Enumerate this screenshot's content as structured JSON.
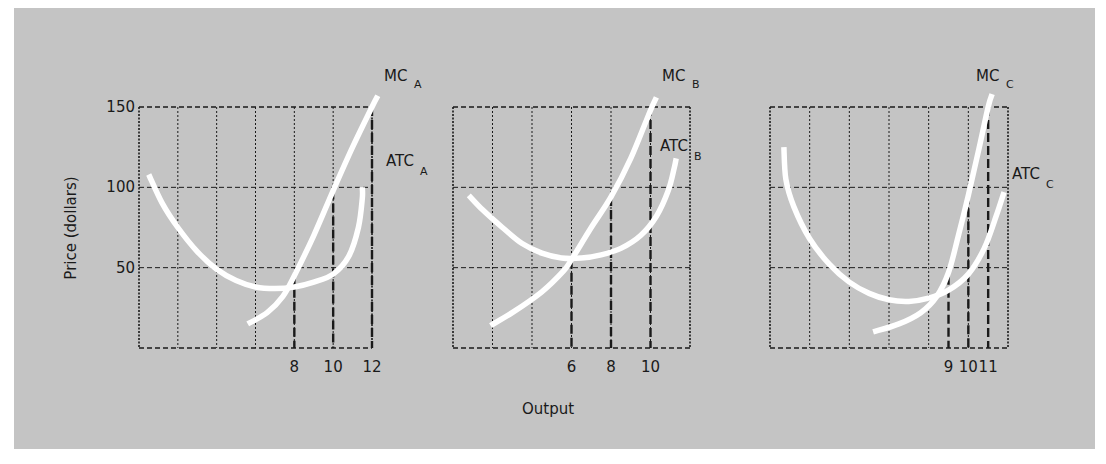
{
  "chart_data": {
    "type": "line",
    "ylabel": "Price (dollars)",
    "xlabel": "Output",
    "colors": {
      "background": "#c4c4c4",
      "curve": "#ffffff",
      "grid": "#1a1a1a",
      "text": "#1a1a1a"
    },
    "panels": [
      {
        "id": "A",
        "xlim": [
          0,
          12
        ],
        "ylim": [
          0,
          150
        ],
        "yticks": [
          50,
          100,
          150
        ],
        "ytick_labels": [
          "50",
          "100",
          "150"
        ],
        "xtick_labels": [
          {
            "value": 8,
            "label": "8"
          },
          {
            "value": 10,
            "label": "10"
          },
          {
            "value": 12,
            "label": "12"
          }
        ],
        "drop_lines": [
          {
            "x": 8,
            "y": 45
          },
          {
            "x": 10,
            "y": 98
          },
          {
            "x": 12,
            "y": 150
          }
        ],
        "series": [
          {
            "name": "MC",
            "subscript": "A",
            "points": [
              [
                5.6,
                15
              ],
              [
                6.6,
                22
              ],
              [
                7.4,
                32
              ],
              [
                8,
                45
              ],
              [
                9,
                70
              ],
              [
                10,
                98
              ],
              [
                11,
                125
              ],
              [
                12,
                150
              ],
              [
                12.3,
                157
              ]
            ]
          },
          {
            "name": "ATC",
            "subscript": "A",
            "points": [
              [
                0.5,
                108
              ],
              [
                1.2,
                90
              ],
              [
                2,
                75
              ],
              [
                3,
                60
              ],
              [
                4,
                49
              ],
              [
                5,
                42
              ],
              [
                6,
                38
              ],
              [
                7,
                37
              ],
              [
                8,
                38
              ],
              [
                9,
                41
              ],
              [
                10,
                46
              ],
              [
                10.8,
                57
              ],
              [
                11.3,
                75
              ],
              [
                11.5,
                93
              ],
              [
                11.5,
                100
              ]
            ]
          }
        ],
        "labels": {
          "mc": "MC",
          "mc_sub": "A",
          "atc": "ATC",
          "atc_sub": "A"
        }
      },
      {
        "id": "B",
        "xlim": [
          0,
          12
        ],
        "ylim": [
          0,
          150
        ],
        "yticks": [
          50,
          100,
          150
        ],
        "xtick_labels": [
          {
            "value": 6,
            "label": "6"
          },
          {
            "value": 8,
            "label": "8"
          },
          {
            "value": 10,
            "label": "10"
          }
        ],
        "drop_lines": [
          {
            "x": 6,
            "y": 55
          },
          {
            "x": 8,
            "y": 94
          },
          {
            "x": 10,
            "y": 150
          }
        ],
        "series": [
          {
            "name": "MC",
            "subscript": "B",
            "points": [
              [
                1.9,
                14
              ],
              [
                3,
                22
              ],
              [
                4.5,
                35
              ],
              [
                5.6,
                48
              ],
              [
                6,
                55
              ],
              [
                7,
                75
              ],
              [
                8,
                94
              ],
              [
                9,
                118
              ],
              [
                10,
                148
              ],
              [
                10.3,
                156
              ]
            ]
          },
          {
            "name": "ATC",
            "subscript": "B",
            "points": [
              [
                0.8,
                95
              ],
              [
                1.5,
                86
              ],
              [
                2.5,
                75
              ],
              [
                3.5,
                65
              ],
              [
                4.5,
                59
              ],
              [
                5.5,
                56
              ],
              [
                6.5,
                56
              ],
              [
                7.5,
                58
              ],
              [
                8.5,
                62
              ],
              [
                9.5,
                70
              ],
              [
                10.3,
                82
              ],
              [
                10.9,
                98
              ],
              [
                11.2,
                112
              ],
              [
                11.3,
                118
              ]
            ]
          }
        ],
        "labels": {
          "mc": "MC",
          "mc_sub": "B",
          "atc": "ATC",
          "atc_sub": "B"
        }
      },
      {
        "id": "C",
        "xlim": [
          0,
          12
        ],
        "ylim": [
          0,
          150
        ],
        "yticks": [
          50,
          100,
          150
        ],
        "xtick_labels": [
          {
            "value": 9,
            "label": "9"
          },
          {
            "value": 10,
            "label": "10"
          },
          {
            "value": 11,
            "label": "11"
          }
        ],
        "drop_lines": [
          {
            "x": 9,
            "y": 45
          },
          {
            "x": 10,
            "y": 95
          },
          {
            "x": 11,
            "y": 150
          }
        ],
        "series": [
          {
            "name": "MC",
            "subscript": "C",
            "points": [
              [
                5.2,
                10
              ],
              [
                6.5,
                15
              ],
              [
                7.6,
                22
              ],
              [
                8.4,
                32
              ],
              [
                9,
                47
              ],
              [
                9.5,
                70
              ],
              [
                10,
                95
              ],
              [
                10.5,
                122
              ],
              [
                11,
                150
              ],
              [
                11.2,
                158
              ]
            ]
          },
          {
            "name": "ATC",
            "subscript": "C",
            "points": [
              [
                0.7,
                125
              ],
              [
                0.8,
                105
              ],
              [
                1.2,
                88
              ],
              [
                2,
                68
              ],
              [
                3,
                52
              ],
              [
                4,
                41
              ],
              [
                5,
                34
              ],
              [
                6,
                30
              ],
              [
                7,
                29
              ],
              [
                8,
                31
              ],
              [
                9,
                36
              ],
              [
                10,
                46
              ],
              [
                10.8,
                62
              ],
              [
                11.4,
                82
              ],
              [
                11.8,
                97
              ]
            ]
          }
        ],
        "labels": {
          "mc": "MC",
          "mc_sub": "C",
          "atc": "ATC",
          "atc_sub": "C"
        }
      }
    ]
  }
}
